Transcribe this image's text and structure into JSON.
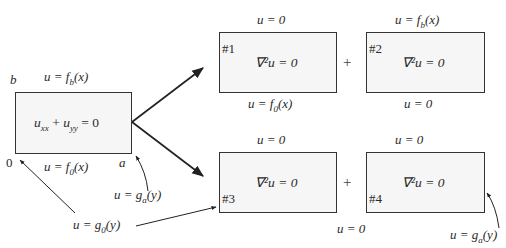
{
  "main": {
    "equation": "u_xx + u_yy = 0",
    "equation_parts": {
      "a": "u",
      "a_sub": "xx",
      "plus": " + ",
      "b": "u",
      "b_sub": "yy",
      "rhs": " = 0"
    },
    "top_bc": {
      "lhs": "u = f",
      "sub": "b",
      "arg": "(x)"
    },
    "bottom_bc": {
      "lhs": "u = f",
      "sub": "0",
      "arg": "(x)"
    },
    "corner_b": "b",
    "corner_0": "0",
    "corner_a": "a",
    "right_bc": {
      "lhs": "u = g",
      "sub": "a",
      "arg": "(y)"
    },
    "left_bc": {
      "lhs": "u = g",
      "sub": "0",
      "arg": "(y)"
    }
  },
  "subproblems": [
    {
      "tag": "#1",
      "equation": "∇²u = 0",
      "top": "u = 0",
      "bottom": {
        "lhs": "u = f",
        "sub": "0",
        "arg": "(x)"
      }
    },
    {
      "tag": "#2",
      "equation": "∇²u = 0",
      "top": {
        "lhs": "u = f",
        "sub": "b",
        "arg": "(x)"
      },
      "bottom": "u = 0"
    },
    {
      "tag": "#3",
      "equation": "∇²u = 0",
      "top": "u = 0",
      "bottom": ""
    },
    {
      "tag": "#4",
      "equation": "∇²u = 0",
      "top": "u = 0",
      "bottom": "",
      "right_bc": {
        "lhs": "u = g",
        "sub": "a",
        "arg": "(y)"
      }
    }
  ],
  "between_bottom": "u = 0",
  "plus_sign": "+"
}
